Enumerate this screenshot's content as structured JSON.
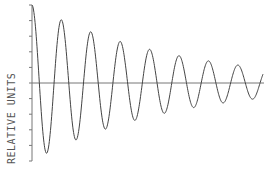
{
  "chart_data": {
    "type": "line",
    "title": "",
    "xlabel": "",
    "ylabel": "RELATIVE UNITS",
    "ylim": [
      -1,
      1
    ],
    "xlim": [
      0,
      7.85
    ],
    "y_ticks_count": 11,
    "y_tick_labels": [],
    "x_tick_labels": [],
    "grid": false,
    "legend": "none",
    "series": [
      {
        "name": "damped-oscillation",
        "x": [
          0,
          0.25,
          0.5,
          0.75,
          1,
          1.25,
          1.5,
          1.75,
          2,
          2.25,
          2.5,
          2.75,
          3,
          3.25,
          3.5,
          3.75,
          4,
          4.25,
          4.5,
          4.75,
          5,
          5.25,
          5.5,
          5.75,
          6,
          6.25,
          6.5,
          6.75,
          7,
          7.25,
          7.5,
          7.75,
          7.85
        ],
        "values": [
          1.0,
          0.0,
          -0.81,
          0.0,
          0.66,
          0.0,
          -0.54,
          0.0,
          0.44,
          0.0,
          -0.36,
          0.0,
          0.29,
          0.0,
          -0.24,
          0.0,
          0.19,
          0.0,
          -0.16,
          0.0,
          0.13,
          0.0,
          -0.11,
          0.0,
          0.09,
          0.0,
          -0.07,
          0.0,
          0.06,
          0.0,
          -0.05,
          0.0,
          0.02
        ]
      }
    ],
    "model": {
      "form": "exp(-k*t)*cos(2*pi*t)",
      "k": 0.21,
      "t_end": 7.85
    }
  }
}
